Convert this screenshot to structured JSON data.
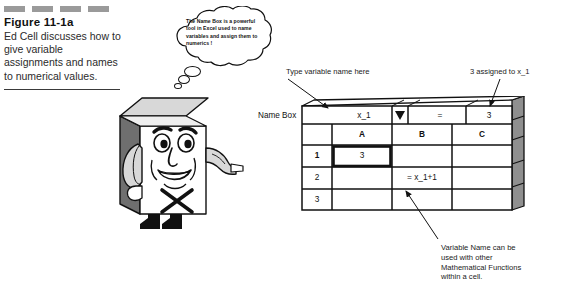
{
  "figure": {
    "deco_bar_count": 4,
    "title": "Figure 11-1a",
    "description": "Ed Cell discusses how to give variable assignments and names to numerical values."
  },
  "thought_bubble": {
    "text": "The Name Box is a powerful tool in Excel used to name variables and assign them to numerics !",
    "trail_dot_count": 3
  },
  "character": {
    "name": "Ed Cell",
    "body_mark": "X"
  },
  "spreadsheet": {
    "name_box_label": "Name Box",
    "name_box_value": "x_1",
    "dropdown_icon": "chevron-down-icon",
    "formula_equals": "=",
    "formula_value": "3",
    "column_headers": [
      "A",
      "B",
      "C"
    ],
    "row_headers": [
      "1",
      "2",
      "3"
    ],
    "cells": {
      "a1": "3",
      "b1": "",
      "c1": "",
      "a2": "",
      "b2": "= x_1+1",
      "c2": "",
      "a3": "",
      "b3": "",
      "c3": ""
    },
    "selected_cell": "a1"
  },
  "annotations": {
    "type_variable": "Type variable name here",
    "three_assigned": "3 assigned to x_1",
    "variable_name_note": "Variable Name can be used with other Mathematical Functions within a cell."
  },
  "colors": {
    "deco_bar": "#9a9a9a",
    "ink": "#111111",
    "sheet_side": "#8f8f8f",
    "sheet_face": "#ffffff"
  }
}
